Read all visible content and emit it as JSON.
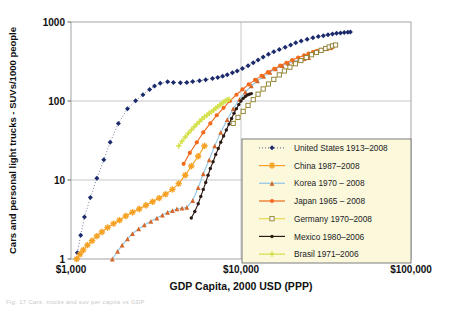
{
  "figure": {
    "caption_partial": "Fig. 17  Cars, trucks and suv per capita vs GDP"
  },
  "chart_data": {
    "type": "scatter",
    "title": "",
    "xlabel": "GDP Capita, 2000 USD (PPP)",
    "ylabel": "Cars and personal light trucks - SUVs/1000 people",
    "xscale": "log",
    "yscale": "log",
    "xlim": [
      1000,
      100000
    ],
    "ylim": [
      1,
      1000
    ],
    "xticks": [
      1000,
      10000,
      100000
    ],
    "xticklabels": [
      "$1,000",
      "$10,000",
      "$100,000"
    ],
    "yticks": [
      1,
      10,
      100,
      1000
    ],
    "yticklabels": [
      "1",
      "10",
      "100",
      "1000"
    ],
    "grid": true,
    "legend_position": "lower-right",
    "series": [
      {
        "name": "United States 1913–2008",
        "label": "United States 1913–2008",
        "marker": "diamond",
        "color": "#1b2a6b",
        "line": "dotted",
        "line_color": "#7a7a9a",
        "points": [
          [
            1090,
            1.2
          ],
          [
            1140,
            2.0
          ],
          [
            1200,
            3.4
          ],
          [
            1300,
            6.0
          ],
          [
            1420,
            10.5
          ],
          [
            1560,
            18.0
          ],
          [
            1700,
            30.0
          ],
          [
            1900,
            52.0
          ],
          [
            2150,
            80.0
          ],
          [
            2400,
            101.0
          ],
          [
            2650,
            120.0
          ],
          [
            2900,
            140.0
          ],
          [
            3100,
            155.0
          ],
          [
            3350,
            168.0
          ],
          [
            3700,
            175.0
          ],
          [
            4000,
            172.0
          ],
          [
            4400,
            170.0
          ],
          [
            4800,
            172.0
          ],
          [
            5200,
            176.0
          ],
          [
            5700,
            180.0
          ],
          [
            6200,
            186.0
          ],
          [
            6800,
            192.0
          ],
          [
            7300,
            198.0
          ],
          [
            7800,
            205.0
          ],
          [
            8300,
            215.0
          ],
          [
            8900,
            228.0
          ],
          [
            9500,
            240.0
          ],
          [
            10200,
            258.0
          ],
          [
            11000,
            280.0
          ],
          [
            11800,
            305.0
          ],
          [
            12600,
            330.0
          ],
          [
            13500,
            360.0
          ],
          [
            14500,
            390.0
          ],
          [
            15600,
            420.0
          ],
          [
            16800,
            450.0
          ],
          [
            18200,
            480.0
          ],
          [
            19600,
            510.0
          ],
          [
            21000,
            545.0
          ],
          [
            22600,
            575.0
          ],
          [
            24500,
            605.0
          ],
          [
            26500,
            630.0
          ],
          [
            28500,
            655.0
          ],
          [
            30500,
            672.0
          ],
          [
            32500,
            690.0
          ],
          [
            34500,
            705.0
          ],
          [
            36500,
            718.0
          ],
          [
            38500,
            728.0
          ],
          [
            40500,
            736.0
          ],
          [
            42500,
            742.0
          ],
          [
            44000,
            745.0
          ]
        ]
      },
      {
        "name": "China 1987–2008",
        "label": "China 1987–2008",
        "marker": "star",
        "color": "#f5a020",
        "line": "solid",
        "line_color": "#f5a020",
        "points": [
          [
            1080,
            1.0
          ],
          [
            1130,
            1.15
          ],
          [
            1180,
            1.3
          ],
          [
            1250,
            1.5
          ],
          [
            1330,
            1.7
          ],
          [
            1420,
            1.95
          ],
          [
            1520,
            2.2
          ],
          [
            1640,
            2.5
          ],
          [
            1780,
            2.8
          ],
          [
            1930,
            3.1
          ],
          [
            2100,
            3.5
          ],
          [
            2300,
            3.9
          ],
          [
            2520,
            4.3
          ],
          [
            2760,
            4.8
          ],
          [
            3020,
            5.3
          ],
          [
            3300,
            5.9
          ],
          [
            3600,
            6.6
          ],
          [
            3950,
            7.6
          ],
          [
            4300,
            9.0
          ],
          [
            4700,
            11.5
          ],
          [
            5100,
            15.0
          ],
          [
            5600,
            20.0
          ],
          [
            6100,
            27.0
          ]
        ]
      },
      {
        "name": "Korea 1970 – 2008",
        "label": "Korea 1970 – 2008",
        "marker": "triangle",
        "color": "#d4682a",
        "line": "solid",
        "line_color": "#8fc7e8",
        "points": [
          [
            1750,
            1.0
          ],
          [
            1880,
            1.25
          ],
          [
            2000,
            1.5
          ],
          [
            2150,
            1.8
          ],
          [
            2300,
            2.1
          ],
          [
            2500,
            2.4
          ],
          [
            2700,
            2.7
          ],
          [
            2950,
            3.0
          ],
          [
            3200,
            3.3
          ],
          [
            3450,
            3.6
          ],
          [
            3700,
            3.9
          ],
          [
            3950,
            4.1
          ],
          [
            4200,
            4.3
          ],
          [
            4500,
            4.4
          ],
          [
            4800,
            4.5
          ],
          [
            5200,
            5.5
          ],
          [
            5600,
            8.0
          ],
          [
            6000,
            12.0
          ],
          [
            6500,
            18.0
          ],
          [
            7000,
            27.0
          ],
          [
            7600,
            40.0
          ],
          [
            8300,
            58.0
          ],
          [
            9000,
            80.0
          ],
          [
            9800,
            105.0
          ],
          [
            10600,
            130.0
          ],
          [
            11500,
            155.0
          ],
          [
            12500,
            180.0
          ],
          [
            13600,
            205.0
          ],
          [
            14800,
            230.0
          ],
          [
            16000,
            255.0
          ],
          [
            17500,
            280.0
          ],
          [
            19000,
            300.0
          ],
          [
            20500,
            318.0
          ],
          [
            22000,
            332.0
          ],
          [
            23500,
            345.0
          ],
          [
            25000,
            355.0
          ]
        ]
      },
      {
        "name": "Japan 1965 – 2008",
        "label": "Japan 1965 – 2008",
        "marker": "circle",
        "color": "#f26a1b",
        "line": "solid",
        "line_color": "#f26a1b",
        "points": [
          [
            4600,
            16.0
          ],
          [
            5000,
            22.0
          ],
          [
            5500,
            30.0
          ],
          [
            6000,
            40.0
          ],
          [
            6600,
            52.0
          ],
          [
            7200,
            66.0
          ],
          [
            7900,
            82.0
          ],
          [
            8600,
            100.0
          ],
          [
            9400,
            120.0
          ],
          [
            10200,
            140.0
          ],
          [
            11100,
            162.0
          ],
          [
            12100,
            185.0
          ],
          [
            13200,
            208.0
          ],
          [
            14400,
            232.0
          ],
          [
            15700,
            256.0
          ],
          [
            17000,
            280.0
          ],
          [
            18500,
            305.0
          ],
          [
            20000,
            330.0
          ],
          [
            21700,
            355.0
          ],
          [
            23500,
            378.0
          ],
          [
            25000,
            398.0
          ],
          [
            26500,
            415.0
          ],
          [
            28000,
            430.0
          ],
          [
            29500,
            443.0
          ],
          [
            31000,
            452.0
          ],
          [
            32500,
            460.0
          ],
          [
            34000,
            466.0
          ]
        ]
      },
      {
        "name": "Germany 1970–2008",
        "label": "Germany 1970–2008",
        "marker": "open-square",
        "color": "#8a7a2a",
        "line": "solid",
        "line_color": "#e9d84a",
        "points": [
          [
            9000,
            52.0
          ],
          [
            9600,
            62.0
          ],
          [
            10300,
            74.0
          ],
          [
            11000,
            88.0
          ],
          [
            11800,
            104.0
          ],
          [
            12600,
            122.0
          ],
          [
            13500,
            142.0
          ],
          [
            14500,
            164.0
          ],
          [
            15600,
            188.0
          ],
          [
            16800,
            214.0
          ],
          [
            18000,
            240.0
          ],
          [
            19400,
            268.0
          ],
          [
            20900,
            296.0
          ],
          [
            22500,
            325.0
          ],
          [
            24200,
            355.0
          ],
          [
            26000,
            385.0
          ],
          [
            27800,
            412.0
          ],
          [
            29600,
            438.0
          ],
          [
            31500,
            462.0
          ],
          [
            33000,
            482.0
          ],
          [
            34500,
            498.0
          ],
          [
            36000,
            512.0
          ]
        ]
      },
      {
        "name": "Mexico 1980–2006",
        "label": "Mexico 1980–2006",
        "marker": "dot",
        "color": "#2b1a14",
        "line": "solid",
        "line_color": "#2b1a14",
        "points": [
          [
            5100,
            3.3
          ],
          [
            5350,
            4.0
          ],
          [
            5600,
            5.0
          ],
          [
            5800,
            6.2
          ],
          [
            6000,
            7.6
          ],
          [
            6200,
            9.3
          ],
          [
            6400,
            11.5
          ],
          [
            6600,
            14.0
          ],
          [
            6850,
            17.0
          ],
          [
            7100,
            21.0
          ],
          [
            7350,
            25.0
          ],
          [
            7600,
            30.0
          ],
          [
            7900,
            36.0
          ],
          [
            8200,
            43.0
          ],
          [
            8500,
            51.0
          ],
          [
            8800,
            60.0
          ],
          [
            9100,
            70.0
          ],
          [
            9400,
            80.0
          ],
          [
            9700,
            90.0
          ],
          [
            10000,
            100.0
          ],
          [
            10300,
            108.0
          ],
          [
            10600,
            114.0
          ],
          [
            10900,
            119.0
          ],
          [
            11200,
            122.0
          ],
          [
            11500,
            124.0
          ]
        ]
      },
      {
        "name": "Brasil 1971–2006",
        "label": "Brasil 1971–2006",
        "marker": "plus",
        "color": "#d4e04a",
        "line": "solid",
        "line_color": "#d4e04a",
        "points": [
          [
            4300,
            27.0
          ],
          [
            4500,
            31.0
          ],
          [
            4700,
            35.0
          ],
          [
            4900,
            39.0
          ],
          [
            5100,
            43.0
          ],
          [
            5300,
            47.0
          ],
          [
            5500,
            51.0
          ],
          [
            5700,
            55.0
          ],
          [
            5900,
            59.0
          ],
          [
            6100,
            63.0
          ],
          [
            6300,
            66.0
          ],
          [
            6500,
            70.0
          ],
          [
            6700,
            73.0
          ],
          [
            6900,
            77.0
          ],
          [
            7100,
            81.0
          ],
          [
            7300,
            85.0
          ],
          [
            7500,
            89.0
          ],
          [
            7700,
            93.0
          ],
          [
            7900,
            97.0
          ],
          [
            8100,
            100.0
          ],
          [
            8300,
            103.0
          ],
          [
            8500,
            105.0
          ]
        ]
      }
    ]
  }
}
